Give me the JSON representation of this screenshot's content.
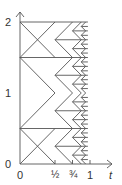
{
  "diagram": {
    "y_labels": {
      "y0": "0",
      "y1": "1",
      "y2": "2"
    },
    "x_labels": {
      "x0": "0",
      "xhalf": "½",
      "x3q": "¾",
      "x1": "1",
      "xt": "t"
    },
    "line_color": "#555555"
  }
}
